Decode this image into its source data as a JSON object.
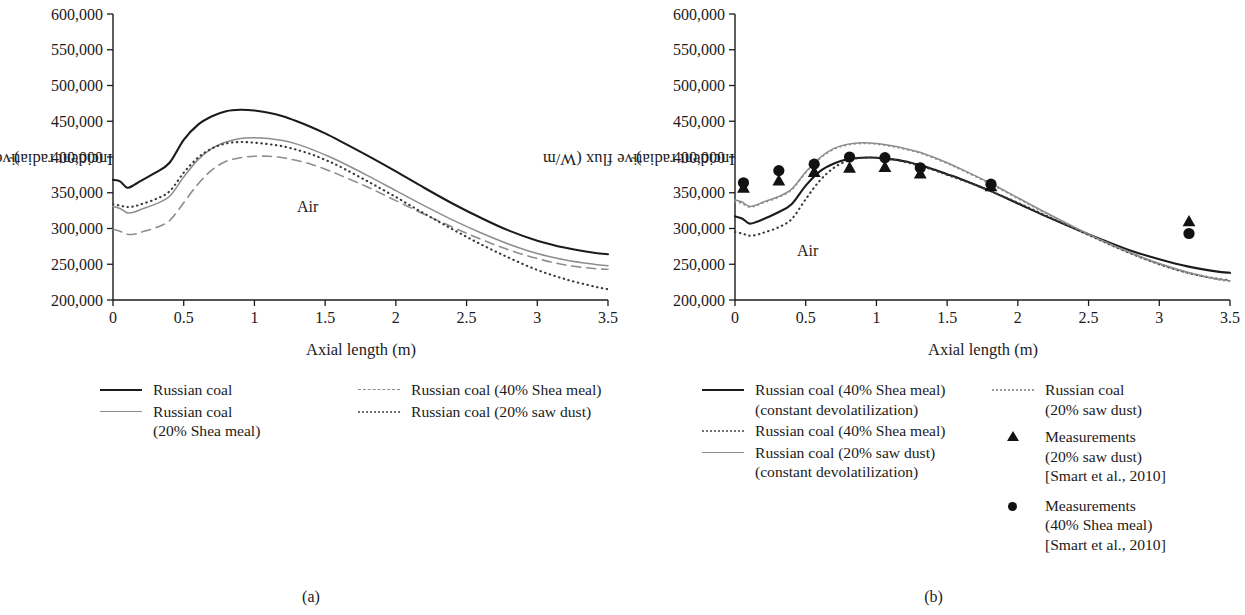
{
  "figure": {
    "captions": [
      {
        "id": "a",
        "text": "(a)"
      },
      {
        "id": "b",
        "text": "(b)"
      }
    ]
  },
  "chart_data": [
    {
      "type": "line",
      "panel": "a",
      "title": "",
      "xlabel": "Axial length (m)",
      "ylabel": "Incident radiative flux (W/m2)",
      "ylabel_base": "Incident radiative flux (W/m",
      "ylabel_sup": "2",
      "ylabel_close": ")",
      "annotation": "Air",
      "xlim": [
        0,
        3.5
      ],
      "ylim": [
        200000,
        600000
      ],
      "xticks": [
        "0",
        "0.5",
        "1",
        "1.5",
        "2",
        "2.5",
        "3",
        "3.5"
      ],
      "xtick_values": [
        0,
        0.5,
        1,
        1.5,
        2,
        2.5,
        3,
        3.5
      ],
      "yticks": [
        "200,000",
        "250,000",
        "300,000",
        "350,000",
        "400,000",
        "450,000",
        "500,000",
        "550,000",
        "600,000"
      ],
      "ytick_values": [
        200000,
        250000,
        300000,
        350000,
        400000,
        450000,
        500000,
        550000,
        600000
      ],
      "grid": false,
      "legend_position": "below",
      "x": [
        0,
        0.05,
        0.1,
        0.15,
        0.2,
        0.3,
        0.4,
        0.5,
        0.6,
        0.7,
        0.8,
        0.9,
        1.0,
        1.1,
        1.2,
        1.3,
        1.4,
        1.5,
        1.6,
        1.8,
        2.0,
        2.2,
        2.4,
        2.6,
        2.8,
        3.0,
        3.2,
        3.4,
        3.5
      ],
      "series": [
        {
          "name": "Russian coal",
          "style": "solid",
          "color": "#1b1b1b",
          "width": 2.1,
          "values": [
            368000,
            366000,
            357000,
            361000,
            367000,
            378000,
            392000,
            424000,
            445000,
            457000,
            464000,
            466000,
            465000,
            462000,
            457000,
            450000,
            442000,
            433000,
            423000,
            402000,
            380000,
            357000,
            335000,
            315000,
            297000,
            283000,
            273000,
            266000,
            264000
          ]
        },
        {
          "name": "Russian coal (20% Shea meal)",
          "style": "solid",
          "color": "#8d8d8d",
          "width": 1.5,
          "values": [
            331000,
            328000,
            322000,
            323000,
            327000,
            334000,
            345000,
            372000,
            396000,
            412000,
            421000,
            426000,
            427000,
            426000,
            423000,
            418000,
            411000,
            403000,
            394000,
            374000,
            353000,
            332000,
            312000,
            294000,
            278000,
            265000,
            256000,
            250000,
            248000
          ]
        },
        {
          "name": "Russian coal (40% Shea meal)",
          "style": "dashed",
          "color": "#8d8d8d",
          "width": 1.6,
          "values": [
            299000,
            296000,
            292000,
            292000,
            295000,
            301000,
            311000,
            336000,
            362000,
            382000,
            394000,
            399000,
            401000,
            401000,
            399000,
            395000,
            390000,
            383000,
            375000,
            358000,
            339000,
            320000,
            302000,
            285000,
            270000,
            258000,
            249000,
            244000,
            243000
          ]
        },
        {
          "name": "Russian coal (20% saw dust)",
          "style": "dotted",
          "color": "#3a3a3a",
          "width": 2.1,
          "values": [
            334000,
            332000,
            330000,
            331000,
            334000,
            341000,
            352000,
            378000,
            399000,
            412000,
            419000,
            421000,
            420000,
            418000,
            415000,
            410000,
            404000,
            396000,
            387000,
            366000,
            344000,
            321000,
            299000,
            278000,
            259000,
            242000,
            229000,
            219000,
            215000
          ]
        }
      ]
    },
    {
      "type": "line",
      "panel": "b",
      "title": "",
      "xlabel": "Axial length (m)",
      "ylabel": "Incident radiative flux (W/m2)",
      "ylabel_base": "Incident radiative flux (W/m",
      "ylabel_sup": "2",
      "ylabel_close": ")",
      "annotation": "Air",
      "xlim": [
        0,
        3.5
      ],
      "ylim": [
        200000,
        600000
      ],
      "xticks": [
        "0",
        "0.5",
        "1",
        "1.5",
        "2",
        "2.5",
        "3",
        "3.5"
      ],
      "xtick_values": [
        0,
        0.5,
        1,
        1.5,
        2,
        2.5,
        3,
        3.5
      ],
      "yticks": [
        "200,000",
        "250,000",
        "300,000",
        "350,000",
        "400,000",
        "450,000",
        "500,000",
        "550,000",
        "600,000"
      ],
      "ytick_values": [
        200000,
        250000,
        300000,
        350000,
        400000,
        450000,
        500000,
        550000,
        600000
      ],
      "grid": false,
      "legend_position": "below",
      "x": [
        0,
        0.05,
        0.1,
        0.15,
        0.2,
        0.3,
        0.4,
        0.5,
        0.6,
        0.7,
        0.8,
        0.9,
        1.0,
        1.1,
        1.2,
        1.3,
        1.4,
        1.5,
        1.6,
        1.8,
        2.0,
        2.2,
        2.4,
        2.6,
        2.8,
        3.0,
        3.2,
        3.4,
        3.5
      ],
      "series": [
        {
          "name": "Russian coal (40% Shea meal) (constant devolatilization)",
          "style": "solid",
          "color": "#1b1b1b",
          "width": 2.1,
          "values": [
            317000,
            314000,
            307000,
            309000,
            313000,
            322000,
            334000,
            360000,
            380000,
            391000,
            397000,
            399000,
            399000,
            397000,
            394000,
            389000,
            383000,
            376000,
            369000,
            353000,
            335000,
            317000,
            300000,
            284000,
            269000,
            257000,
            247000,
            240000,
            238000
          ]
        },
        {
          "name": "Russian coal (40% Shea meal)",
          "style": "dotted",
          "color": "#3a3a3a",
          "width": 2.1,
          "values": [
            295000,
            293000,
            290000,
            291000,
            294000,
            301000,
            313000,
            341000,
            367000,
            385000,
            395000,
            399000,
            399000,
            397000,
            393000,
            388000,
            382000,
            375000,
            368000,
            353000,
            336000,
            318000,
            300000,
            282000,
            265000,
            250000,
            238000,
            230000,
            228000
          ]
        },
        {
          "name": "Russian coal (20% saw dust) (constant devolatilization)",
          "style": "solid",
          "color": "#8d8d8d",
          "width": 1.5,
          "values": [
            340000,
            337000,
            331000,
            333000,
            337000,
            344000,
            355000,
            379000,
            399000,
            412000,
            418000,
            420000,
            419000,
            416000,
            412000,
            407000,
            400000,
            392000,
            383000,
            364000,
            343000,
            322000,
            302000,
            283000,
            266000,
            251000,
            239000,
            230000,
            227000
          ]
        },
        {
          "name": "Russian coal (20% saw dust)",
          "style": "dotted",
          "color": "#8d8d8d",
          "width": 1.8,
          "values": [
            338000,
            335000,
            330000,
            332000,
            336000,
            343000,
            354000,
            378000,
            398000,
            411000,
            417000,
            419000,
            418000,
            415000,
            411000,
            406000,
            399000,
            391000,
            382000,
            363000,
            342000,
            321000,
            301000,
            282000,
            265000,
            250000,
            238000,
            229000,
            226000
          ]
        }
      ],
      "markers": [
        {
          "name": "Measurements (20% saw dust) [Smart et al., 2010]",
          "shape": "triangle",
          "color": "#121212",
          "points": [
            [
              0.06,
              357000
            ],
            [
              0.31,
              367000
            ],
            [
              0.56,
              379000
            ],
            [
              0.81,
              385000
            ],
            [
              1.06,
              386000
            ],
            [
              1.31,
              377000
            ],
            [
              1.81,
              359000
            ],
            [
              3.21,
              310000
            ]
          ]
        },
        {
          "name": "Measurements (40% Shea meal) [Smart et al., 2010]",
          "shape": "circle",
          "color": "#121212",
          "points": [
            [
              0.06,
              364000
            ],
            [
              0.31,
              381000
            ],
            [
              0.56,
              390000
            ],
            [
              0.81,
              400000
            ],
            [
              1.06,
              399000
            ],
            [
              1.31,
              385000
            ],
            [
              1.81,
              362000
            ],
            [
              3.21,
              293000
            ]
          ]
        }
      ]
    }
  ],
  "legend_a": {
    "entries": [
      {
        "key": "solid-dark",
        "label": "Russian coal"
      },
      {
        "key": "solid-gray",
        "label": "Russian coal\n(20% Shea meal)"
      },
      {
        "key": "dashed-gray",
        "label": "Russian coal (40% Shea meal)"
      },
      {
        "key": "dotted-dark",
        "label": "Russian coal (20% saw dust)"
      }
    ]
  },
  "legend_b": {
    "entries": [
      {
        "key": "solid-dark",
        "label": "Russian coal (40% Shea meal)\n(constant devolatilization)"
      },
      {
        "key": "dotted-dark",
        "label": "Russian coal (40% Shea meal)"
      },
      {
        "key": "solid-gray",
        "label": "Russian coal (20% saw dust)\n(constant devolatilization)"
      },
      {
        "key": "dotted-gray",
        "label": "Russian coal\n(20% saw dust)"
      },
      {
        "key": "triangle",
        "label": "Measurements\n(20% saw dust)\n[Smart et al., 2010]"
      },
      {
        "key": "circle",
        "label": "Measurements\n(40% Shea meal)\n[Smart et al., 2010]"
      }
    ]
  }
}
